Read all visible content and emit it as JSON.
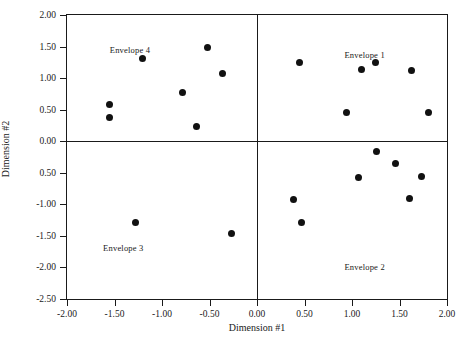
{
  "chart_data": {
    "type": "scatter",
    "title": "",
    "xlabel": "Dimension #1",
    "ylabel": "Dimension #2",
    "xlim": [
      -2.0,
      2.0
    ],
    "ylim": [
      -2.5,
      2.0
    ],
    "grid": false,
    "legend": "none",
    "quadrant_dividers": {
      "x": 0.0,
      "y": 0.0
    },
    "xticks": [
      "-2.00",
      "-1.50",
      "-1.00",
      "-0.50",
      "0.00",
      "0.50",
      "1.00",
      "1.50",
      "2.00"
    ],
    "xtick_values": [
      -2.0,
      -1.5,
      -1.0,
      -0.5,
      0.0,
      0.5,
      1.0,
      1.5,
      2.0
    ],
    "yticks": [
      "2.00",
      "1.50",
      "1.00",
      "0.50",
      "0.00",
      "0.50",
      "-1.00",
      "-1.50",
      "-2.00",
      "-2.50"
    ],
    "ytick_values": [
      2.0,
      1.5,
      1.0,
      0.5,
      0.0,
      -0.5,
      -1.0,
      -1.5,
      -2.0,
      -2.5
    ],
    "annotations": [
      {
        "text": "Envelope 4",
        "x": -1.55,
        "y": 1.52
      },
      {
        "text": "Envelope 1",
        "x": 0.92,
        "y": 1.45
      },
      {
        "text": "Envelope 3",
        "x": -1.62,
        "y": -1.62
      },
      {
        "text": "Envelope 2",
        "x": 0.92,
        "y": -1.92
      }
    ],
    "points": [
      {
        "x": -1.55,
        "y": 0.58,
        "group": "Envelope 4"
      },
      {
        "x": -1.55,
        "y": 0.38,
        "group": "Envelope 4"
      },
      {
        "x": -1.21,
        "y": 1.31,
        "group": "Envelope 4"
      },
      {
        "x": -0.78,
        "y": 0.77,
        "group": "Envelope 4"
      },
      {
        "x": -0.64,
        "y": 0.24,
        "group": "Envelope 4"
      },
      {
        "x": -0.52,
        "y": 1.48,
        "group": "Envelope 4"
      },
      {
        "x": -0.36,
        "y": 1.08,
        "group": "Envelope 4"
      },
      {
        "x": 0.45,
        "y": 1.24,
        "group": "Envelope 1"
      },
      {
        "x": 0.94,
        "y": 0.46,
        "group": "Envelope 1"
      },
      {
        "x": 1.1,
        "y": 1.13,
        "group": "Envelope 1"
      },
      {
        "x": 1.25,
        "y": 1.24,
        "group": "Envelope 1"
      },
      {
        "x": 1.63,
        "y": 1.12,
        "group": "Envelope 1"
      },
      {
        "x": 1.81,
        "y": 0.45,
        "group": "Envelope 1"
      },
      {
        "x": -1.28,
        "y": -1.28,
        "group": "Envelope 3"
      },
      {
        "x": -0.27,
        "y": -1.46,
        "group": "Envelope 3"
      },
      {
        "x": 0.38,
        "y": -0.93,
        "group": "Envelope 2"
      },
      {
        "x": 0.47,
        "y": -1.28,
        "group": "Envelope 2"
      },
      {
        "x": 1.07,
        "y": -0.58,
        "group": "Envelope 2"
      },
      {
        "x": 1.26,
        "y": -0.17,
        "group": "Envelope 2"
      },
      {
        "x": 1.46,
        "y": -0.35,
        "group": "Envelope 2"
      },
      {
        "x": 1.6,
        "y": -0.9,
        "group": "Envelope 2"
      },
      {
        "x": 1.73,
        "y": -0.56,
        "group": "Envelope 2"
      }
    ]
  }
}
